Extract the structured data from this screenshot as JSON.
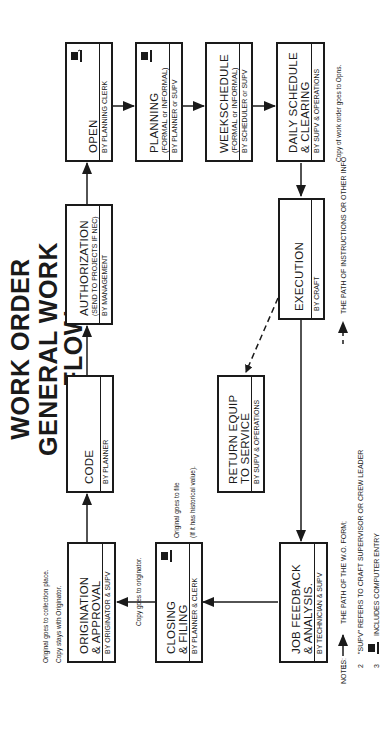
{
  "title": {
    "line1": "WORK ORDER",
    "line2": "GENERAL WORK FLOW"
  },
  "boxes": {
    "open": {
      "title": "OPEN",
      "subtitle": "",
      "by": "BY PLANNING CLERK",
      "computer_entry": true
    },
    "planning": {
      "title": "PLANNING",
      "subtitle": "(FORMAL or INFORMAL)",
      "by": "BY PLANNER or SUPV",
      "computer_entry": true
    },
    "weekschedule": {
      "title": "WEEKSCHEDULE",
      "subtitle": "(FORMAL or INFORMAL)",
      "by": "BY SCHEDULER or SUPV",
      "computer_entry": false
    },
    "daily": {
      "title_line1": "DAILY SCHEDULE",
      "title_line2": "& CLEARING",
      "by": "BY SUPV & OPERATIONS",
      "computer_entry": false
    },
    "authorization": {
      "title": "AUTHORIZATION",
      "subtitle": "(SEND TO PROJECTS IF NEC)",
      "by": "BY MANAGEMENT",
      "computer_entry": false
    },
    "execution": {
      "title": "EXECUTION",
      "by": "BY CRAFT",
      "computer_entry": false
    },
    "code": {
      "title": "CODE",
      "by": "BY PLANNER",
      "computer_entry": false
    },
    "return_equip": {
      "title_line1": "RETURN EQUIP",
      "title_line2": "TO SERVICE",
      "by": "BY SUPV & OPERATIONS",
      "computer_entry": false
    },
    "origination": {
      "title_line1": "ORIGINATION",
      "title_line2": "& APPROVAL",
      "by": "BY ORIGINATOR & SUPV",
      "computer_entry": false
    },
    "closing": {
      "title_line1": "CLOSING",
      "title_line2": "& FILING",
      "by": "BY PLANNER & CLERK",
      "computer_entry": true
    },
    "job_feedback": {
      "title_line1": "JOB FEEDBACK",
      "title_line2": "& ANALYSIS.",
      "by": "BY TECHNICIAN & SUPV",
      "computer_entry": false
    }
  },
  "annotations": {
    "origination_1": "Original goes to collection place.",
    "origination_2": "Copy stays with Originator.",
    "closing_copy": "Copy goes to originator.",
    "closing_file_1": "Original goes to file",
    "closing_file_2": "(If it has historical value).",
    "daily_copy": "Copy of work order goes to Opns."
  },
  "notes": {
    "label": "NOTES:",
    "items": [
      {
        "num": "1.",
        "solid_text": "THE PATH OF THE W.O. FORM;",
        "dashed_text": "THE PATH OF INSTRUCTIONS OR OTHER INFO"
      },
      {
        "num": "2",
        "text": "\"SUPV\" REFERS TO CRAFT SUPERVISOR OR CREW LEADER"
      },
      {
        "num": "3",
        "text": "INCLUDES COMPUTER ENTRY"
      }
    ]
  },
  "colors": {
    "ink": "#1a1a1a",
    "paper": "#ffffff"
  }
}
